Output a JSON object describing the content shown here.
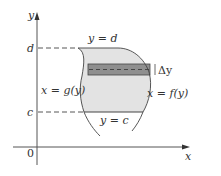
{
  "figure": {
    "type": "region-between-curves-horizontal-strip",
    "axes": {
      "x_label": "x",
      "y_label": "y",
      "origin_label": "0"
    },
    "levels": {
      "top_label": "d",
      "bottom_label": "c"
    },
    "boundaries": {
      "top": "y = d",
      "bottom": "y = c",
      "left": "x = g(y)",
      "right": "x = f(y)"
    },
    "strip": {
      "width_label": "Δy"
    },
    "colors": {
      "region_fill": "#e3e3e3",
      "strip_fill": "#8f8f8f",
      "line": "#444444",
      "axis": "#555555"
    }
  }
}
